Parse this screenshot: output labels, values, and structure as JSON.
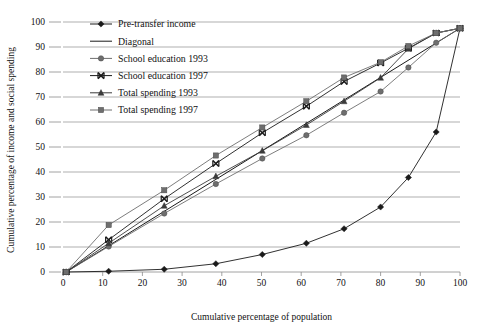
{
  "chart_data": {
    "type": "line",
    "title": "",
    "xlabel": "Cumulative percentage of population",
    "ylabel": "Cumulative percentage of income and social spending",
    "xlim": [
      0,
      100
    ],
    "ylim": [
      0,
      100
    ],
    "xticks": [
      0,
      10,
      20,
      30,
      40,
      50,
      60,
      70,
      80,
      90,
      100
    ],
    "yticks": [
      0,
      10,
      20,
      30,
      40,
      50,
      60,
      70,
      80,
      90,
      100
    ],
    "grid": "horizontal",
    "legend_position": "top-left-inside",
    "series": [
      {
        "name": "Pre-transfer income",
        "marker": "diamond",
        "color": "#1a1a1a",
        "x": [
          0.8,
          11.5,
          25.5,
          38.5,
          50.2,
          61.3,
          70.8,
          80.0,
          87.0,
          94.0,
          100.0
        ],
        "y": [
          0.0,
          0.3,
          1.1,
          3.3,
          7.0,
          11.5,
          17.3,
          26.0,
          37.8,
          56.0,
          97.5
        ]
      },
      {
        "name": "Diagonal",
        "marker": "none",
        "color": "#1a1a1a",
        "x": [
          0.8,
          100.0
        ],
        "y": [
          0.0,
          97.5
        ]
      },
      {
        "name": "School education 1993",
        "marker": "circle",
        "color": "#6e6e6e",
        "x": [
          0.8,
          11.5,
          25.5,
          38.5,
          50.2,
          61.3,
          70.8,
          80.0,
          87.0,
          94.0,
          100.0
        ],
        "y": [
          0.0,
          10.2,
          23.4,
          35.2,
          45.4,
          54.7,
          63.7,
          72.2,
          81.8,
          91.7,
          97.5
        ]
      },
      {
        "name": "School education 1997",
        "marker": "x",
        "color": "#1a1a1a",
        "x": [
          0.8,
          11.5,
          25.5,
          38.5,
          50.2,
          61.3,
          70.8,
          80.0,
          87.0,
          94.0,
          100.0
        ],
        "y": [
          0.0,
          12.9,
          29.3,
          43.4,
          55.7,
          66.3,
          76.2,
          83.6,
          89.5,
          95.6,
          97.5
        ]
      },
      {
        "name": "Total spending 1993",
        "marker": "triangle",
        "color": "#3b3b3b",
        "x": [
          0.8,
          11.5,
          25.5,
          38.5,
          50.2,
          61.3,
          70.8,
          80.0,
          87.0,
          94.0,
          100.0
        ],
        "y": [
          0.0,
          11.5,
          26.5,
          38.3,
          48.5,
          58.8,
          68.3,
          77.7,
          89.3,
          95.6,
          97.5
        ]
      },
      {
        "name": "Total spending 1997",
        "marker": "square",
        "color": "#6e6e6e",
        "x": [
          0.8,
          11.5,
          25.5,
          38.5,
          50.2,
          61.3,
          70.8,
          80.0,
          87.0,
          94.0,
          100.0
        ],
        "y": [
          0.0,
          18.8,
          32.7,
          46.6,
          57.8,
          68.3,
          77.8,
          83.9,
          90.4,
          95.6,
          97.5
        ]
      }
    ],
    "legend_entries": [
      {
        "label": "Pre-transfer income",
        "marker": "diamond",
        "color": "#1a1a1a"
      },
      {
        "label": "Diagonal",
        "marker": "none",
        "color": "#1a1a1a"
      },
      {
        "label": "School education 1993",
        "marker": "circle",
        "color": "#6e6e6e"
      },
      {
        "label": "School education 1997",
        "marker": "x",
        "color": "#1a1a1a"
      },
      {
        "label": "Total spending 1993",
        "marker": "triangle",
        "color": "#3b3b3b"
      },
      {
        "label": "Total spending 1997",
        "marker": "square",
        "color": "#6e6e6e"
      }
    ]
  }
}
